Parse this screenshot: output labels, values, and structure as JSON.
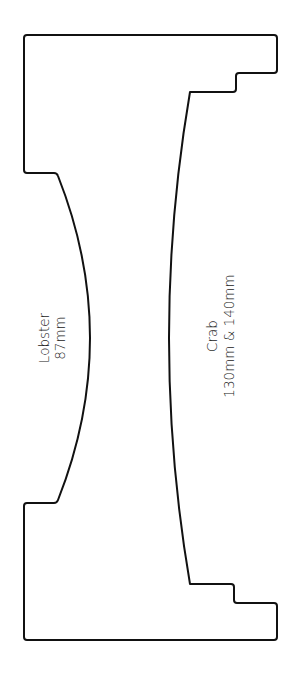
{
  "diagram": {
    "type": "template outline",
    "labels": {
      "left": {
        "line1": "Lobster",
        "line2": "87mm"
      },
      "right": {
        "line1": "Crab",
        "line2": "130mm & 140mm"
      }
    },
    "colors": {
      "stroke": "#111111",
      "background": "#ffffff",
      "text": "#222222"
    }
  }
}
